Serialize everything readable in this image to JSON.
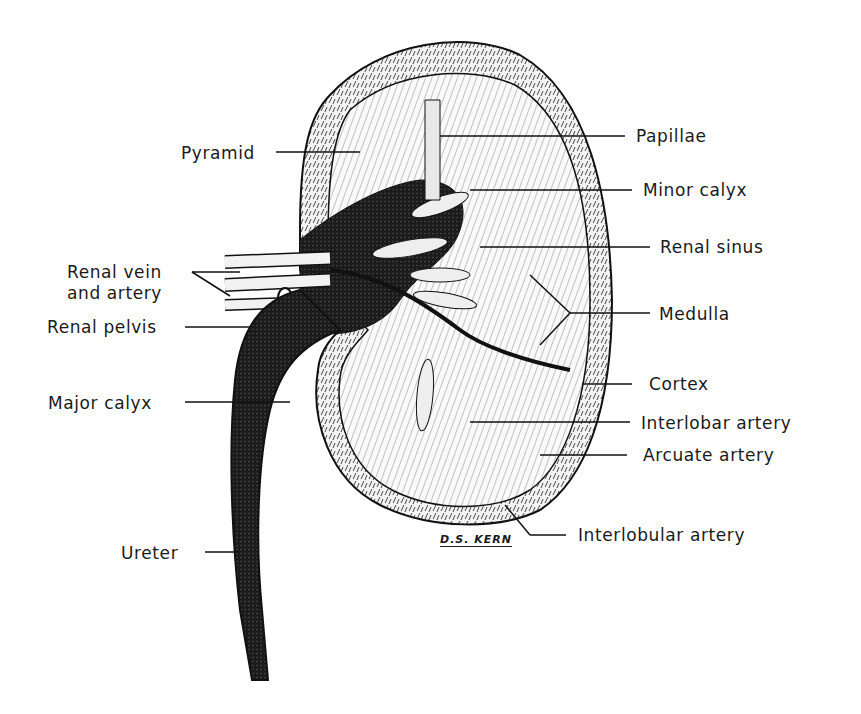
{
  "figure": {
    "signature": "D.S. KERN"
  },
  "labels_left": [
    {
      "id": "pyramid",
      "text": "Pyramid"
    },
    {
      "id": "renal-vein-artery-1",
      "text": "Renal vein"
    },
    {
      "id": "renal-vein-artery-2",
      "text": "and artery"
    },
    {
      "id": "renal-pelvis",
      "text": "Renal pelvis"
    },
    {
      "id": "major-calyx",
      "text": "Major calyx"
    },
    {
      "id": "ureter",
      "text": "Ureter"
    }
  ],
  "labels_right": [
    {
      "id": "papillae",
      "text": "Papillae"
    },
    {
      "id": "minor-calyx",
      "text": "Minor calyx"
    },
    {
      "id": "renal-sinus",
      "text": "Renal sinus"
    },
    {
      "id": "medulla",
      "text": "Medulla"
    },
    {
      "id": "cortex",
      "text": "Cortex"
    },
    {
      "id": "interlobar-artery",
      "text": "Interlobar artery"
    },
    {
      "id": "arcuate-artery",
      "text": "Arcuate artery"
    },
    {
      "id": "interlobular-artery",
      "text": "Interlobular artery"
    }
  ]
}
